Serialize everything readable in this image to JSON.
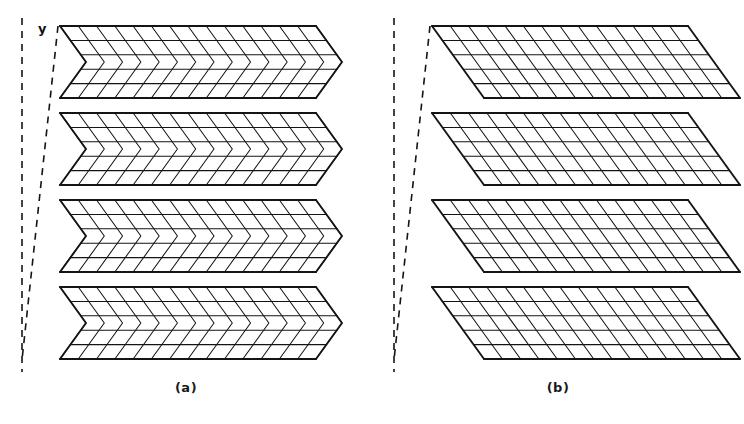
{
  "figure": {
    "background_color": "#ffffff",
    "line_color": "#141414",
    "panels": [
      {
        "id": "a",
        "caption": "(a)",
        "axis_label": "y",
        "kind": "corrugated-chevron-surface",
        "description": "Zig-zag (chevron) folded layered surface",
        "layers": 4,
        "columns": 14,
        "rows_per_layer": 5,
        "fold_direction": "chevron-right"
      },
      {
        "id": "b",
        "caption": "(b)",
        "axis_label": "y",
        "kind": "flat-parallelogram-sheets",
        "description": "Flat unfolded parallelogram sheets stacked vertically",
        "layers": 4,
        "columns": 14,
        "rows_per_layer": 5,
        "fold_direction": "none"
      }
    ]
  },
  "chart_data": {
    "type": "diagram",
    "title": "",
    "panels": [
      {
        "label": "(a)",
        "geometry": "corrugated",
        "axis": "y",
        "layer_count": 4,
        "grid_columns": 14,
        "grid_rows": 5,
        "layer_top_y": [
          26,
          113,
          200,
          287
        ],
        "layer_height": 72,
        "left_x": 60,
        "right_x": 316,
        "chevron_apex_x": 232,
        "skew_dx": 26,
        "dashed_vertical_x": 22,
        "dashed_slant_top": [
          58,
          26
        ],
        "dashed_slant_bottom": [
          22,
          360
        ]
      },
      {
        "label": "(b)",
        "geometry": "flat",
        "axis": "y",
        "layer_count": 4,
        "grid_columns": 14,
        "grid_rows": 5,
        "layer_top_y": [
          26,
          113,
          200,
          287
        ],
        "layer_height": 72,
        "left_x": 60,
        "right_x": 316,
        "skew_dx": 52,
        "dashed_vertical_x": 22,
        "dashed_slant_top": [
          58,
          26
        ],
        "dashed_slant_bottom": [
          22,
          360
        ]
      }
    ]
  }
}
